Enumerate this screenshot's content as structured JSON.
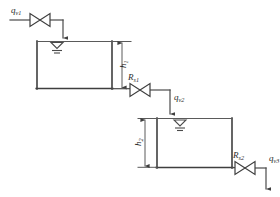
{
  "diagram": {
    "type": "process-schematic",
    "background_color": "#ffffff",
    "line_color": "#3f3f3f",
    "text_color": "#2b2b2b"
  },
  "labels": {
    "inflow_1": {
      "base": "q",
      "sub": "v1",
      "full": "qv1"
    },
    "flow_2": {
      "base": "q",
      "sub": "v2",
      "full": "qv2"
    },
    "flow_3": {
      "base": "q",
      "sub": "v3",
      "full": "qv3"
    },
    "height_1": {
      "base": "h",
      "sub": "1",
      "full": "h1"
    },
    "height_2": {
      "base": "h",
      "sub": "2",
      "full": "h2"
    },
    "resistance_1": {
      "base": "R",
      "sub": "s1",
      "full": "Rs1"
    },
    "resistance_2": {
      "base": "R",
      "sub": "s2",
      "full": "Rs2"
    }
  },
  "components": {
    "tank_1": {
      "name": "upper-tank",
      "x": 37,
      "y": 41,
      "width": 75,
      "height": 48
    },
    "tank_2": {
      "name": "lower-tank",
      "x": 157,
      "y": 118,
      "width": 75,
      "height": 50
    },
    "valve_1": {
      "name": "inlet-valve",
      "cx": 40,
      "cy": 20
    },
    "valve_2": {
      "name": "resistance-valve-1",
      "cx": 140,
      "cy": 90
    },
    "valve_3": {
      "name": "resistance-valve-2",
      "cx": 245,
      "cy": 168
    },
    "level_symbol_1": {
      "name": "liquid-level-symbol-tank-1",
      "cx": 57,
      "cy": 44
    },
    "level_symbol_2": {
      "name": "liquid-level-symbol-tank-2",
      "cx": 180,
      "cy": 122
    }
  },
  "dimensions": {
    "h1": {
      "x": 122,
      "y_top": 42,
      "y_bottom": 89
    },
    "h2": {
      "x": 145,
      "y_top": 120,
      "y_bottom": 166
    }
  },
  "icons": {
    "valve": "bowtie-valve-icon",
    "liquid_level": "liquid-level-icon",
    "flow_arrow": "flow-arrow-icon",
    "dimension_arrow": "dimension-arrow-icon"
  }
}
